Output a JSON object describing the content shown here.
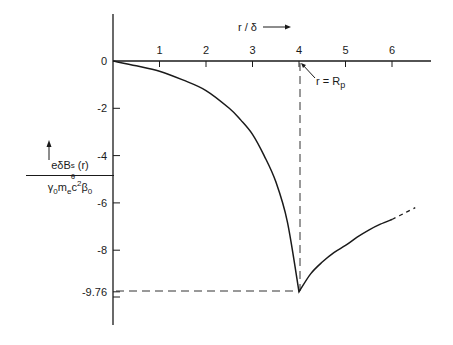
{
  "chart_data": {
    "type": "line",
    "title": "",
    "xlabel": "r / δ",
    "ylabel": "e δ B_θ^s(r) / (γ0 me c² β0)",
    "ylabel_parts": {
      "numerator": "eδB",
      "num_sup": "s",
      "num_sub": "θ",
      "num_tail": "(r)",
      "denominator_parts": [
        "γ",
        "0",
        "m",
        "e",
        "c",
        "2",
        "β",
        "0"
      ]
    },
    "xlim": [
      0,
      7
    ],
    "ylim": [
      -11,
      2
    ],
    "x_ticks": [
      1,
      2,
      3,
      4,
      5,
      6
    ],
    "x_tick_labels": [
      "1",
      "2",
      "3",
      "4",
      "5",
      "6"
    ],
    "y_ticks": [
      0,
      -2,
      -4,
      -6,
      -8,
      -9.76
    ],
    "y_tick_labels": [
      "0",
      "-2",
      "-4",
      "-6",
      "-8",
      "-9.76"
    ],
    "grid": false,
    "legend": null,
    "annotations": [
      {
        "text": "r = R",
        "sub": "p",
        "x": 4,
        "y": 0,
        "note": "arrow points to r/δ = 4 on x-axis"
      },
      {
        "text": "-9.76",
        "note": "dashed reference lines mark minimum at (4, -9.76)"
      }
    ],
    "series": [
      {
        "name": "solid",
        "x": [
          0,
          0.5,
          1,
          1.5,
          2,
          2.5,
          2.75,
          3,
          3.25,
          3.5,
          3.75,
          4,
          4.25,
          4.5,
          4.75,
          5,
          5.25,
          5.5,
          5.75,
          6
        ],
        "values": [
          0,
          -0.2,
          -0.43,
          -0.8,
          -1.25,
          -2.0,
          -2.5,
          -3.1,
          -4.0,
          -5.1,
          -6.8,
          -9.76,
          -9.0,
          -8.5,
          -8.1,
          -7.8,
          -7.45,
          -7.15,
          -6.9,
          -6.7
        ]
      },
      {
        "name": "dashed-extrapolation",
        "x": [
          6,
          6.25,
          6.5
        ],
        "values": [
          -6.7,
          -6.45,
          -6.2
        ]
      }
    ],
    "minimum": {
      "x": 4,
      "y": -9.76
    }
  }
}
